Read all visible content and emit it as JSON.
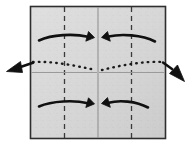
{
  "figure": {
    "kind": "origami-fold-diagram",
    "title": "",
    "canvas": {
      "width": 191,
      "height": 153,
      "background": "#ffffff"
    }
  },
  "paper": {
    "name": "square-sheet",
    "x": 30.5,
    "y": 6.5,
    "width": 135,
    "height": 132,
    "fill": "#d6d6d6",
    "stroke": "#2e2e2e",
    "stroke_width": 1.6,
    "texture": "speckled-paper"
  },
  "crease_lines": [
    {
      "id": "valley-left",
      "label": "left vertical crease",
      "orientation": "vertical",
      "style": "dashed",
      "x1": 64.5,
      "y1": 7,
      "x2": 64.5,
      "y2": 138,
      "color": "#3a3a3a",
      "width": 1.3,
      "dash": "5,4"
    },
    {
      "id": "valley-right",
      "label": "right vertical crease",
      "orientation": "vertical",
      "style": "dashed",
      "x1": 131.5,
      "y1": 7,
      "x2": 131.5,
      "y2": 138,
      "color": "#3a3a3a",
      "width": 1.3,
      "dash": "5,4"
    },
    {
      "id": "center-vert",
      "label": "center vertical crease",
      "orientation": "vertical",
      "style": "solid",
      "x1": 98.0,
      "y1": 7,
      "x2": 98.0,
      "y2": 138,
      "color": "#8d8d8d",
      "width": 1.0,
      "dash": "none"
    },
    {
      "id": "center-horiz-left",
      "label": "left half horizontal crease",
      "orientation": "horizontal",
      "style": "solid",
      "x1": 31,
      "y1": 72.5,
      "x2": 97,
      "y2": 72.5,
      "color": "#9a9a9a",
      "width": 1.0,
      "dash": "none"
    },
    {
      "id": "center-horiz-right",
      "label": "right half horizontal crease",
      "orientation": "horizontal",
      "style": "solid",
      "x1": 99,
      "y1": 72.5,
      "x2": 165,
      "y2": 72.5,
      "color": "#9a9a9a",
      "width": 1.0,
      "dash": "none"
    }
  ],
  "dotted_guides": [
    {
      "id": "hidden-edge-left",
      "label": "hidden layer guide, left side",
      "path": "M 33 62 C 55 61 76 66 96 70",
      "color": "#1a1a1a",
      "width": 2.4,
      "dash": "0.6,5.2"
    },
    {
      "id": "hidden-edge-right",
      "label": "hidden layer guide, right side",
      "path": "M 102 70 C 122 65 144 61 163 62",
      "color": "#1a1a1a",
      "width": 2.4,
      "dash": "0.6,5.2"
    }
  ],
  "motion_arrows": [
    {
      "id": "arrow-top-left",
      "label": "fold top-left panel to the right",
      "direction": "right",
      "path": "M 39 40.5 C 52 34.5 74 33.5 88 36.8",
      "head": "M 88.5 31.5 L 94.5 37.6 L 85.8 41.2 Z",
      "color": "#111111",
      "width": 2.6
    },
    {
      "id": "arrow-top-right",
      "label": "fold top-right panel to the left",
      "direction": "left",
      "path": "M 155 41.5 C 142 34.8 121 33.6 108.5 36.6",
      "head": "M 107.5 31.5 L 101.5 37.4 L 110.3 41.2 Z",
      "color": "#111111",
      "width": 2.6
    },
    {
      "id": "arrow-bottom-left",
      "label": "fold bottom-left panel to the right",
      "direction": "right",
      "path": "M 39 106.5 C 52 100.8 74 100 88 103.2",
      "head": "M 88.5 97.8 L 94.5 103.9 L 85.8 107.5 Z",
      "color": "#111111",
      "width": 2.6
    },
    {
      "id": "arrow-bottom-right",
      "label": "fold bottom-right panel to the left",
      "direction": "left",
      "path": "M 148 107.5 C 136 101 119 99.8 108.5 102.8",
      "head": "M 107.5 97.6 L 101.5 103.5 L 110.3 107.3 Z",
      "color": "#111111",
      "width": 2.6
    },
    {
      "id": "arrow-pull-left",
      "label": "pull left edge outward",
      "direction": "out-left",
      "path": "M 33 62.8 L 19 67.5",
      "head": "M 6.5 71.5 L 20.5 61.5 L 22.5 72.5 Z",
      "color": "#111111",
      "width": 2.6
    },
    {
      "id": "arrow-pull-right",
      "label": "pull right edge outward",
      "direction": "out-right",
      "path": "M 163 62.5 L 172 69",
      "head": "M 184.5 81.5 L 169.5 73.5 L 177.5 65 Z",
      "color": "#111111",
      "width": 2.6
    }
  ]
}
